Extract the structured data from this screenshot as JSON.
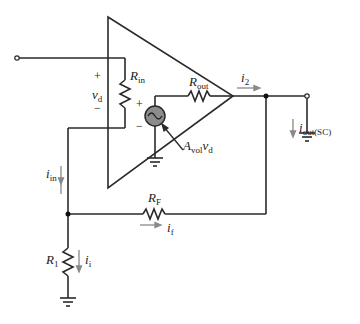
{
  "diagram": {
    "labels": {
      "plus_vd": "+",
      "minus_vd": "−",
      "vd_main": "v",
      "vd_sub": "d",
      "rin_main": "R",
      "rin_sub": "in",
      "rout_main": "R",
      "rout_sub": "out",
      "src_plus": "+",
      "src_minus": "−",
      "gain_main": "A",
      "gain_sub": "vol",
      "gain_var": "v",
      "gain_var_sub": "d",
      "i2_main": "i",
      "i2_sub": "2",
      "iout_main": "i",
      "iout_sub": "out(SC)",
      "iin_main": "i",
      "iin_sub": "in",
      "rf_main": "R",
      "rf_sub": "F",
      "if_main": "i",
      "if_sub": "f",
      "r1_main": "R",
      "r1_sub": "1",
      "i1_main": "i",
      "i1_sub": "i"
    },
    "colors": {
      "wire": "#2a2a2a",
      "arrow": "#888888",
      "source_fill": "#8c8c8c"
    }
  }
}
